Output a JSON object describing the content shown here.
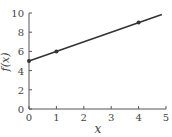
{
  "chart_data": {
    "type": "line",
    "title": "",
    "xlabel": "x",
    "ylabel": "f(x)",
    "xlim": [
      0,
      5
    ],
    "ylim": [
      0,
      10
    ],
    "x_ticks": [
      "0",
      "1",
      "2",
      "3",
      "4",
      "5"
    ],
    "y_ticks": [
      "0",
      "2",
      "4",
      "6",
      "8",
      "10"
    ],
    "grid": false,
    "series": [
      {
        "name": "f(x)",
        "x": [
          0,
          4.85
        ],
        "y": [
          5,
          9.85
        ]
      }
    ],
    "marked_points": [
      {
        "x": 0,
        "y": 5
      },
      {
        "x": 1,
        "y": 6
      },
      {
        "x": 4,
        "y": 9
      }
    ]
  }
}
